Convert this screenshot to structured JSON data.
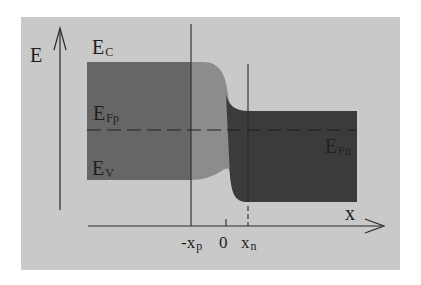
{
  "diagram": {
    "type": "pn-junction-band-diagram",
    "axes": {
      "y_label": "E",
      "x_label": "x"
    },
    "energy_levels": {
      "conduction": {
        "main": "E",
        "sub": "C"
      },
      "fermi_p": {
        "main": "E",
        "sub": "Fp"
      },
      "valence": {
        "main": "E",
        "sub": "V"
      },
      "fermi_n": {
        "main": "E",
        "sub": "Fn"
      }
    },
    "x_ticks": {
      "neg_xp": {
        "main": "-x",
        "sub": "p"
      },
      "zero": "0",
      "xn": {
        "main": "x",
        "sub": "n"
      }
    },
    "colors": {
      "background": "#ffffff",
      "panel": "#c9c9c9",
      "p_band": "#666666",
      "depletion_band": "#8c8c8c",
      "n_band": "#3b3b3b",
      "lines": "#2a2a2a"
    }
  }
}
